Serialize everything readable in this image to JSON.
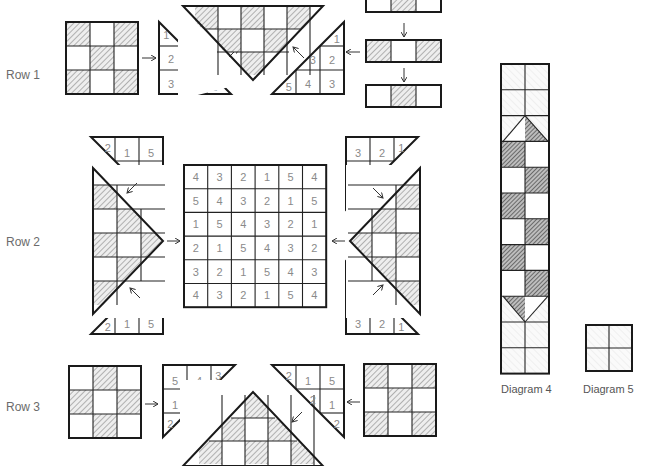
{
  "labels": {
    "row1": "Row 1",
    "row2": "Row 2",
    "row3": "Row 3",
    "diagram4": "Diagram 4",
    "diagram5": "Diagram 5"
  },
  "colors": {
    "line": "#1a1a1a",
    "hatch_light": "#bdbdbd",
    "hatch_dark": "#7a7a7a",
    "number": "#8a8a8a",
    "label": "#6b6b6b"
  },
  "row1": {
    "block_pattern": [
      [
        1,
        0,
        1
      ],
      [
        0,
        1,
        0
      ],
      [
        1,
        0,
        1
      ]
    ],
    "left_triangle_numbers": [
      "1",
      "2",
      "1",
      "3",
      "2",
      "1"
    ],
    "right_triangle_numbers": [
      "1",
      "2",
      "3",
      "5",
      "4",
      "3"
    ],
    "top_triangle_pattern": [
      [
        1,
        0,
        1,
        0,
        1
      ],
      [
        0,
        1,
        0,
        1
      ],
      [
        1
      ]
    ],
    "strips": [
      [
        0,
        1,
        0
      ],
      [
        1,
        0,
        1
      ],
      [
        0,
        1,
        0
      ]
    ]
  },
  "row2": {
    "grid": [
      [
        "4",
        "3",
        "2",
        "1",
        "5",
        "4"
      ],
      [
        "5",
        "4",
        "3",
        "2",
        "1",
        "5"
      ],
      [
        "1",
        "5",
        "4",
        "3",
        "2",
        "1"
      ],
      [
        "2",
        "1",
        "5",
        "4",
        "3",
        "2"
      ],
      [
        "3",
        "2",
        "1",
        "5",
        "4",
        "3"
      ],
      [
        "4",
        "3",
        "2",
        "1",
        "5",
        "4"
      ]
    ],
    "left_top_triangle_numbers": [
      "2",
      "1",
      "5",
      "2",
      "1",
      "2"
    ],
    "left_bottom_triangle_numbers": [
      "3",
      "5",
      "4",
      "2",
      "1",
      "5"
    ],
    "right_top_triangle_numbers": [
      "3",
      "2",
      "1",
      "4",
      "3",
      "5"
    ],
    "right_bottom_triangle_numbers": [
      "1",
      "2",
      "1",
      "3",
      "2",
      "1"
    ]
  },
  "row3": {
    "left_block_pattern": [
      [
        0,
        1,
        0
      ],
      [
        1,
        0,
        1
      ],
      [
        0,
        1,
        0
      ]
    ],
    "right_block_pattern": [
      [
        1,
        0,
        1
      ],
      [
        0,
        1,
        0
      ],
      [
        1,
        0,
        1
      ]
    ],
    "left_triangle_numbers": [
      "5",
      "4",
      "3",
      "1",
      "5",
      "2"
    ],
    "right_triangle_numbers": [
      "2",
      "1",
      "5",
      "2",
      "1",
      "2"
    ]
  },
  "diagram4": {
    "columns": 2,
    "rows": 12
  },
  "diagram5": {
    "columns": 2,
    "rows": 2
  }
}
